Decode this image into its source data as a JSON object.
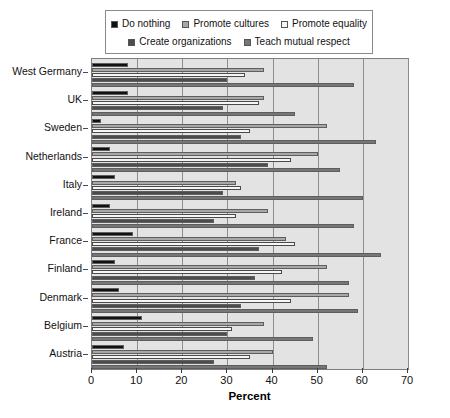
{
  "chart_data": {
    "type": "bar",
    "orientation": "horizontal",
    "title": "",
    "xlabel": "Percent",
    "ylabel": "",
    "xlim": [
      0,
      70
    ],
    "xticks": [
      0,
      10,
      20,
      30,
      40,
      50,
      60,
      70
    ],
    "grid": true,
    "legend_position": "top",
    "categories": [
      "West Germany",
      "UK",
      "Sweden",
      "Netherlands",
      "Italy",
      "Ireland",
      "France",
      "Finland",
      "Denmark",
      "Belgium",
      "Austria"
    ],
    "series": [
      {
        "name": "Do nothing",
        "color": "#111111",
        "values": [
          8,
          8,
          2,
          4,
          5,
          4,
          9,
          5,
          6,
          11,
          7
        ]
      },
      {
        "name": "Promote cultures",
        "color": "#a8a8a8",
        "values": [
          38,
          38,
          52,
          50,
          32,
          39,
          43,
          52,
          57,
          38,
          40
        ]
      },
      {
        "name": "Promote equality",
        "color": "#f6f6f6",
        "values": [
          34,
          37,
          35,
          44,
          33,
          32,
          45,
          42,
          44,
          31,
          35
        ]
      },
      {
        "name": "Create organizations",
        "color": "#4c4c4c",
        "values": [
          30,
          29,
          33,
          39,
          29,
          27,
          37,
          36,
          33,
          30,
          27
        ]
      },
      {
        "name": "Teach mutual respect",
        "color": "#767676",
        "values": [
          58,
          45,
          63,
          55,
          60,
          58,
          64,
          57,
          59,
          49,
          52
        ]
      }
    ]
  },
  "legend": {
    "items": [
      {
        "label": "Do nothing",
        "color": "#111111"
      },
      {
        "label": "Promote cultures",
        "color": "#a8a8a8"
      },
      {
        "label": "Promote equality",
        "color": "#f6f6f6"
      },
      {
        "label": "Create organizations",
        "color": "#4c4c4c"
      },
      {
        "label": "Teach mutual respect",
        "color": "#767676"
      }
    ]
  }
}
